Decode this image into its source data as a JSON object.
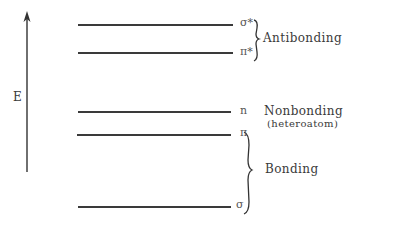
{
  "axis": {
    "label": "E",
    "direction": "up"
  },
  "levels": [
    {
      "id": "sigma-star",
      "symbol": "σ*",
      "group": "antibonding"
    },
    {
      "id": "pi-star",
      "symbol": "π*",
      "group": "antibonding"
    },
    {
      "id": "n",
      "symbol": "n",
      "group": "nonbonding"
    },
    {
      "id": "pi",
      "symbol": "π",
      "group": "bonding"
    },
    {
      "id": "sigma",
      "symbol": "σ",
      "group": "bonding"
    }
  ],
  "groups": {
    "antibonding": "Antibonding",
    "nonbonding": "Nonbonding",
    "nonbonding_note": "(heteroatom)",
    "bonding": "Bonding"
  }
}
